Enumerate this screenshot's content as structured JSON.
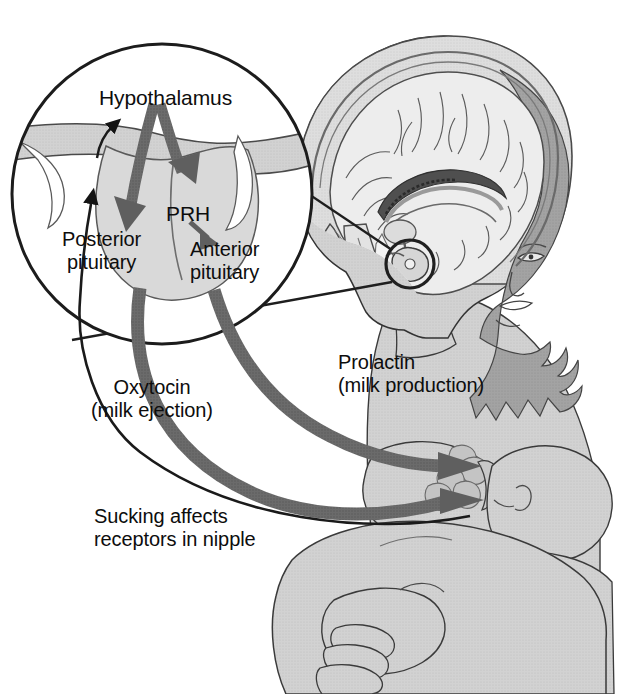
{
  "figure": {
    "width": 620,
    "height": 694,
    "background_color": "#ffffff"
  },
  "labels": {
    "hypothalamus": "Hypothalamus",
    "prh": "PRH",
    "posterior_pituitary_line1": "Posterior",
    "posterior_pituitary_line2": "pituitary",
    "anterior_pituitary_line1": "Anterior",
    "anterior_pituitary_line2": "pituitary",
    "oxytocin_line1": "Oxytocin",
    "oxytocin_line2": "(milk ejection)",
    "prolactin_line1": "Prolactin",
    "prolactin_line2": "(milk production)",
    "sucking_line1": "Sucking affects",
    "sucking_line2": "receptors in nipple"
  },
  "colors": {
    "text": "#0d0d0d",
    "outline": "#2b2b2b",
    "hormone_arrow": "#6b6b6b",
    "neural_arrow": "#1a1a1a",
    "body_fill": "#d2d2d2",
    "body_shadow": "#b4b4b4",
    "hair": "#a0a0a0",
    "brain_fill": "#e2e2e2",
    "brain_mid": "#c2c2c2",
    "brain_dark": "#8a8a8a",
    "gland_fill": "#d8d8d8",
    "gland_stalk": "#8f8f8f",
    "background": "#ffffff"
  },
  "elements": {
    "magnifier_circle": "inset-magnification-circle",
    "head_profile": "woman-head-sagittal-section",
    "brain": "brain-midsagittal",
    "pituitary_marker": "pituitary-circle-marker",
    "infant": "nursing-infant",
    "breast": "breast-with-nipple",
    "arm": "supporting-arm-and-hand"
  },
  "pathways": [
    {
      "name": "sucking-afferent",
      "from": "nipple",
      "to": "hypothalamus",
      "style": "thin-black-arrow",
      "label": "Sucking affects receptors in nipple"
    },
    {
      "name": "hypothalamus-to-posterior-pituitary",
      "from": "hypothalamus",
      "to": "posterior pituitary",
      "style": "thick-gray-arrow"
    },
    {
      "name": "hypothalamus-to-anterior-pituitary",
      "from": "hypothalamus",
      "to": "anterior pituitary",
      "style": "thick-gray-arrow"
    },
    {
      "name": "prh-to-anterior-pituitary",
      "from": "PRH",
      "to": "anterior pituitary",
      "style": "small-gray-arrow"
    },
    {
      "name": "oxytocin-to-breast",
      "from": "posterior pituitary",
      "to": "breast",
      "style": "thick-gray-arrow",
      "label": "Oxytocin (milk ejection)"
    },
    {
      "name": "prolactin-to-breast",
      "from": "anterior pituitary",
      "to": "breast",
      "style": "thick-gray-arrow",
      "label": "Prolactin (milk production)"
    }
  ]
}
